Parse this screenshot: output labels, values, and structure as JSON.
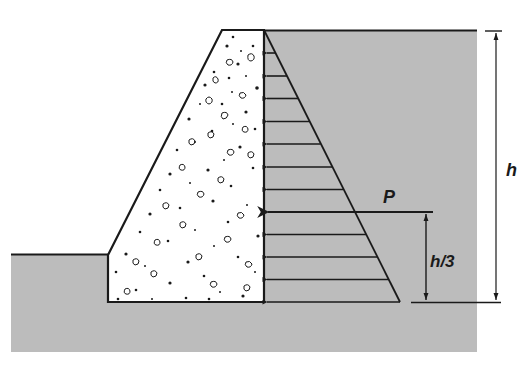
{
  "diagram": {
    "labels": {
      "resultant_force": "P",
      "resultant_height": "h/3",
      "wall_height": "h"
    },
    "colors": {
      "soil_fill": "#bcbcbc",
      "concrete": "#ffffff",
      "line": "#1a1a1a",
      "background": "#ffffff"
    },
    "components": [
      {
        "id": "concrete-gravity-wall",
        "description": "Trapezoidal concrete retaining wall with aggregate speckle"
      },
      {
        "id": "retained-soil",
        "description": "Gray backfill soil on the right of the wall"
      },
      {
        "id": "front-soil",
        "description": "Gray ground at the left toe of the wall"
      },
      {
        "id": "pressure-diagram",
        "description": "Triangular lateral earth pressure, increasing with depth, 12 arrows"
      },
      {
        "id": "resultant-arrow",
        "description": "Resultant force P acting at h/3 above base"
      },
      {
        "id": "height-dimension",
        "description": "Total height h dimension line"
      },
      {
        "id": "h3-dimension",
        "description": "h/3 dimension line from base to P"
      }
    ],
    "pressure_arrow_count": 12
  }
}
